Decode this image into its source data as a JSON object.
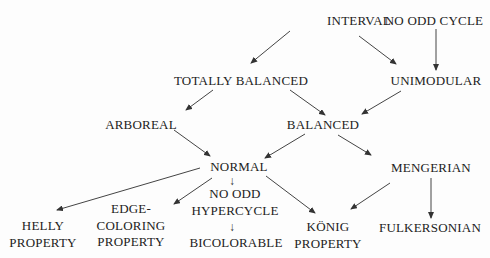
{
  "diagram": {
    "type": "hierarchy of hypergraph/matrix properties",
    "nodes": {
      "interval": {
        "label": "INTERVAL"
      },
      "no_odd_cycle": {
        "label": "NO ODD CYCLE"
      },
      "totally_balanced": {
        "label": "TOTALLY BALANCED"
      },
      "unimodular": {
        "label": "UNIMODULAR"
      },
      "arboreal": {
        "label": "ARBOREAL"
      },
      "balanced": {
        "label": "BALANCED"
      },
      "normal": {
        "label": "NORMAL"
      },
      "mengerian": {
        "label": "MENGERIAN"
      },
      "no_odd_hypercycle": {
        "line1": "NO ODD",
        "line2": "HYPERCYCLE"
      },
      "bicolorable": {
        "label": "BICOLORABLE"
      },
      "helly_property": {
        "line1": "HELLY",
        "line2": "PROPERTY"
      },
      "edge_coloring_property": {
        "line1": "EDGE-",
        "line2": "COLORING",
        "line3": "PROPERTY"
      },
      "konig_property": {
        "line1": "KÖNIG",
        "line2": "PROPERTY"
      },
      "fulkersonian": {
        "label": "FULKERSONIAN"
      }
    },
    "arrow_glyph": "↓",
    "edges": [
      {
        "from": "INTERVAL",
        "to": "TOTALLY BALANCED"
      },
      {
        "from": "INTERVAL",
        "to": "UNIMODULAR"
      },
      {
        "from": "NO ODD CYCLE",
        "to": "UNIMODULAR"
      },
      {
        "from": "TOTALLY BALANCED",
        "to": "ARBOREAL"
      },
      {
        "from": "TOTALLY BALANCED",
        "to": "BALANCED"
      },
      {
        "from": "UNIMODULAR",
        "to": "BALANCED"
      },
      {
        "from": "ARBOREAL",
        "to": "NORMAL"
      },
      {
        "from": "BALANCED",
        "to": "NORMAL"
      },
      {
        "from": "BALANCED",
        "to": "MENGERIAN"
      },
      {
        "from": "NORMAL",
        "to": "HELLY PROPERTY"
      },
      {
        "from": "NORMAL",
        "to": "EDGE-COLORING PROPERTY"
      },
      {
        "from": "NORMAL",
        "to": "NO ODD HYPERCYCLE"
      },
      {
        "from": "NO ODD HYPERCYCLE",
        "to": "BICOLORABLE"
      },
      {
        "from": "NORMAL",
        "to": "KÖNIG PROPERTY"
      },
      {
        "from": "MENGERIAN",
        "to": "KÖNIG PROPERTY"
      },
      {
        "from": "MENGERIAN",
        "to": "FULKERSONIAN"
      }
    ],
    "colors": {
      "background": "#fdfdfd",
      "ink": "#222222"
    }
  }
}
